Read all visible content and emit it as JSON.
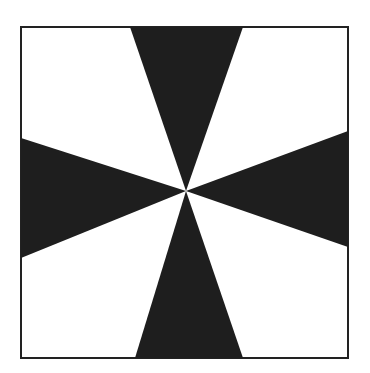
{
  "diagram": {
    "type": "cross-pattern",
    "frame": {
      "x1": 21,
      "y1": 27,
      "x2": 348,
      "y2": 358,
      "stroke": "#222222"
    },
    "center": {
      "x": 186,
      "y": 191
    },
    "fill_color": "#1e1e1e",
    "background": "#ffffff",
    "wedges": [
      {
        "name": "top",
        "points": "130,27 243,27 186,191"
      },
      {
        "name": "bottom",
        "points": "135,358 243,358 186,191"
      },
      {
        "name": "left",
        "points": "21,138 21,258 186,191"
      },
      {
        "name": "right",
        "points": "348,131 348,247 186,191"
      }
    ]
  }
}
